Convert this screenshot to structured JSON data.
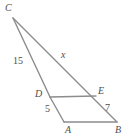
{
  "figure": {
    "kind": "geometry-diagram",
    "background_color": "#ffffff",
    "line_color": "#8c8c8c",
    "text_color": "#4d4d4d",
    "vertices": {
      "C": {
        "label": "C",
        "x": 13,
        "y": 18
      },
      "D": {
        "label": "D",
        "x": 50,
        "y": 97
      },
      "E": {
        "label": "E",
        "x": 96,
        "y": 96
      },
      "A": {
        "label": "A",
        "x": 64,
        "y": 122
      },
      "B": {
        "label": "B",
        "x": 117,
        "y": 122
      }
    },
    "segments": [
      {
        "name": "segment-CD",
        "from": "C",
        "to": "D"
      },
      {
        "name": "segment-DA",
        "from": "D",
        "to": "A"
      },
      {
        "name": "segment-CE",
        "from": "C",
        "to": "E"
      },
      {
        "name": "segment-EB",
        "from": "E",
        "to": "B"
      },
      {
        "name": "segment-DE",
        "from": "D",
        "to": "E"
      },
      {
        "name": "segment-AB",
        "from": "A",
        "to": "B"
      }
    ],
    "measures": {
      "cd": "15",
      "da": "5",
      "eb": "7",
      "ce": "x"
    }
  }
}
